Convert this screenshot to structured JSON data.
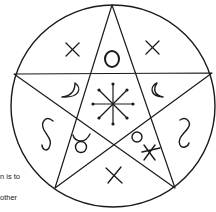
{
  "diagram": {
    "ink_color": "#1a1a1a",
    "background": "#ffffff",
    "symbols": {
      "top_left": "×",
      "top_center": "○",
      "top_right": "×",
      "mid_left_moon": "waxing crescent",
      "mid_right_moon": "waning crescent",
      "center": "eight-spoked star",
      "far_left": "S",
      "far_right": "reversed S",
      "lower_left": "♉",
      "lower_right": "ox",
      "bottom": "×"
    }
  },
  "text_fragments": [
    "n is to",
    "other"
  ]
}
